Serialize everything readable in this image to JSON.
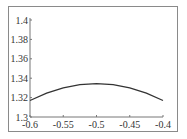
{
  "chart_data": {
    "type": "line",
    "title": "",
    "xlabel": "",
    "ylabel": "",
    "xlim": [
      -0.6,
      -0.4
    ],
    "ylim": [
      1.3,
      1.4
    ],
    "grid": false,
    "legend": null,
    "x_ticks": [
      "-0.6",
      "-0.55",
      "-0.5",
      "-0.45",
      "-0.4"
    ],
    "y_ticks": [
      "1.3",
      "1.32",
      "1.34",
      "1.36",
      "1.38",
      "1.4"
    ],
    "series": [
      {
        "name": "curve",
        "x": [
          -0.6,
          -0.575,
          -0.55,
          -0.525,
          -0.5,
          -0.475,
          -0.45,
          -0.425,
          -0.4
        ],
        "y": [
          1.317,
          1.3245,
          1.3301,
          1.3334,
          1.3345,
          1.3334,
          1.3301,
          1.3245,
          1.317
        ]
      }
    ],
    "line_color": "#333333"
  }
}
